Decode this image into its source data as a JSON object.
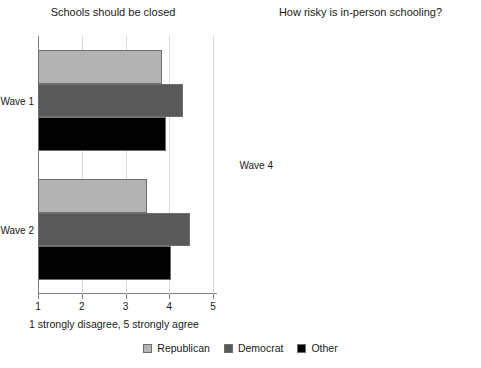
{
  "chart_data": [
    {
      "type": "bar",
      "orientation": "horizontal",
      "title": "Schools should be closed",
      "xlabel": "1 strongly disagree, 5 strongly agree",
      "ylabel": "",
      "xlim": [
        1,
        5
      ],
      "xticks": [
        1,
        2,
        3,
        4,
        5
      ],
      "xticklabels": [
        "1",
        "2",
        "3",
        "4",
        "5"
      ],
      "grid": true,
      "legend_position": "bottom",
      "categories": [
        "Wave 1",
        "Wave 2"
      ],
      "series": [
        {
          "name": "Republican",
          "color": "#b3b3b3",
          "values": [
            3.84,
            3.49
          ]
        },
        {
          "name": "Democrat",
          "color": "#595959",
          "values": [
            4.31,
            4.48
          ]
        },
        {
          "name": "Other",
          "color": "#000000",
          "values": [
            3.93,
            4.05
          ]
        }
      ]
    },
    {
      "type": "bar",
      "orientation": "horizontal",
      "title": "How risky is in-person schooling?",
      "xlabel": "1 low risk, 10 high risk",
      "ylabel": "",
      "xlim": [
        1,
        10
      ],
      "xticks": [
        1,
        2,
        3,
        4,
        5,
        6,
        7,
        8,
        9,
        10
      ],
      "xticklabels": [
        "1",
        "2",
        "3",
        "4",
        "5",
        "6",
        "7",
        "8",
        "9",
        "10"
      ],
      "grid": true,
      "legend_position": "bottom",
      "categories": [
        "Wave 4"
      ],
      "series": [
        {
          "name": "Republican",
          "color": "#b3b3b3",
          "values": [
            4.9
          ]
        },
        {
          "name": "Democrat",
          "color": "#595959",
          "values": [
            8.1
          ]
        },
        {
          "name": "Other",
          "color": "#000000",
          "values": [
            6.45
          ]
        }
      ]
    }
  ],
  "left": {
    "title": "Schools should be closed",
    "caption": "1 strongly disagree, 5 strongly agree",
    "ticklabels": [
      "1",
      "2",
      "3",
      "4",
      "5"
    ],
    "groups": [
      "Wave 1",
      "Wave 2"
    ]
  },
  "right": {
    "title": "How risky is in-person schooling?",
    "caption": "1 low risk, 10 high risk",
    "ticklabels": [
      "1",
      "2",
      "3",
      "4",
      "5",
      "6",
      "7",
      "8",
      "9",
      "10"
    ],
    "groups": [
      "Wave 4"
    ]
  },
  "legend": {
    "items": [
      {
        "label": "Republican",
        "color": "#b3b3b3"
      },
      {
        "label": "Democrat",
        "color": "#595959"
      },
      {
        "label": "Other",
        "color": "#000000"
      }
    ]
  }
}
